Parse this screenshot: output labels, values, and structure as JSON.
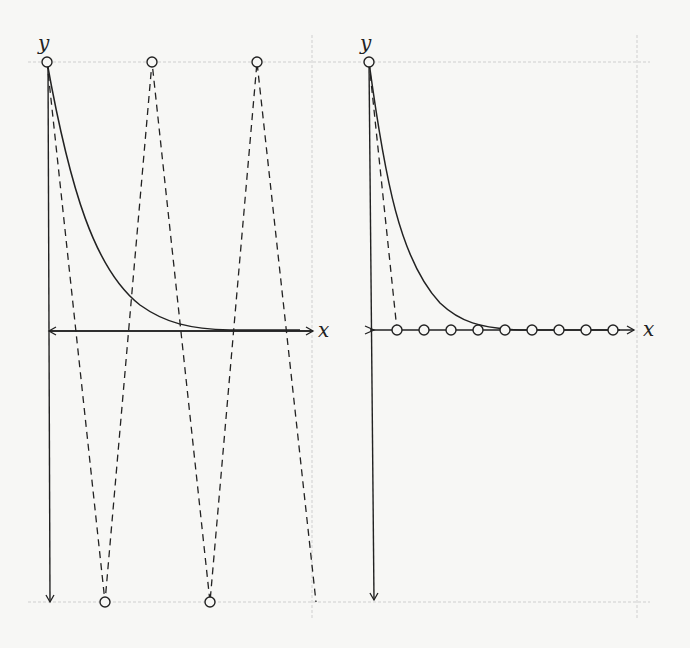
{
  "figure": {
    "panels": [
      {
        "id": "left",
        "x_label": "x",
        "y_label": "y",
        "description": "Decaying exponential curve with dashed zigzag between top and bottom points"
      },
      {
        "id": "right",
        "x_label": "x",
        "y_label": "y",
        "description": "Decaying exponential curve with points lying on the x-axis"
      }
    ],
    "colors": {
      "ink": "#222222",
      "grid": "#c8c8c8",
      "background": "#f7f7f5"
    }
  }
}
